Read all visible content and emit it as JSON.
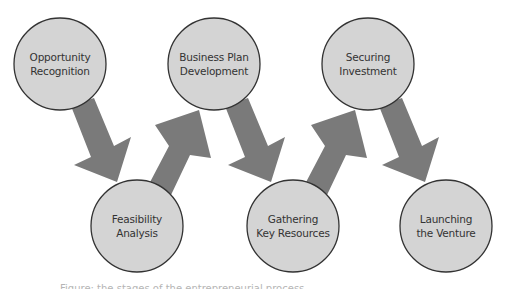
{
  "diagram": {
    "colors": {
      "background": "#ffffff",
      "node_fill": "#d4d4d4",
      "node_stroke": "#333333",
      "arrow_fill": "#7a7a7a",
      "text": "#333333"
    },
    "nodes": [
      {
        "id": "opportunity-recognition",
        "line1": "Opportunity",
        "line2": "Recognition",
        "cx": 60,
        "cy": 64,
        "r": 46
      },
      {
        "id": "feasibility-analysis",
        "line1": "Feasibility",
        "line2": "Analysis",
        "cx": 137,
        "cy": 226,
        "r": 46
      },
      {
        "id": "business-plan-development",
        "line1": "Business Plan",
        "line2": "Development",
        "cx": 214,
        "cy": 64,
        "r": 46
      },
      {
        "id": "gathering-key-resources",
        "line1": "Gathering",
        "line2": "Key Resources",
        "cx": 293,
        "cy": 226,
        "r": 46
      },
      {
        "id": "securing-investment",
        "line1": "Securing",
        "line2": "Investment",
        "cx": 368,
        "cy": 64,
        "r": 46
      },
      {
        "id": "launching-the-venture",
        "line1": "Launching",
        "line2": "the Venture",
        "cx": 446,
        "cy": 226,
        "r": 46
      }
    ],
    "arrows": [
      {
        "from": "opportunity-recognition",
        "to": "feasibility-analysis",
        "direction": "down"
      },
      {
        "from": "feasibility-analysis",
        "to": "business-plan-development",
        "direction": "up"
      },
      {
        "from": "business-plan-development",
        "to": "gathering-key-resources",
        "direction": "down"
      },
      {
        "from": "gathering-key-resources",
        "to": "securing-investment",
        "direction": "up"
      },
      {
        "from": "securing-investment",
        "to": "launching-the-venture",
        "direction": "down"
      }
    ],
    "caption": "Figure: the stages of the entrepreneurial process"
  }
}
